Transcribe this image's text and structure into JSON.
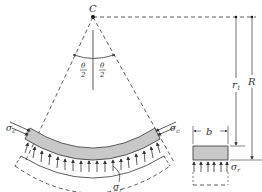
{
  "figure": {
    "center_label": "C",
    "half_angle_top": "θ",
    "half_angle_bottom": "2",
    "inner_radius_label": "r",
    "inner_radius_subscript": "1",
    "outer_radius_label": "R",
    "width_label": "b",
    "circumferential_stress_label": "σ",
    "circumferential_stress_subscript": "c",
    "radial_stress_label": "σ",
    "radial_stress_subscript": "r"
  },
  "colors": {
    "line": "#333333",
    "beam_fill": "#c8c8c8",
    "background": "#ffffff"
  }
}
